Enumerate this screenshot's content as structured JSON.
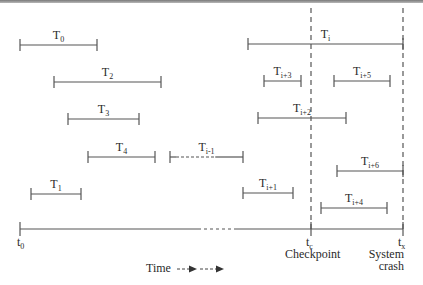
{
  "diagram": {
    "type": "transaction-timeline",
    "colors": {
      "line": "#555555",
      "text": "#2a2a2a",
      "rule": "#8a8a8a"
    },
    "transactions": [
      {
        "id": "T0",
        "base": "T",
        "sub": "0",
        "x1": 20,
        "x2": 97,
        "y": 45,
        "style": "solid"
      },
      {
        "id": "T2",
        "base": "T",
        "sub": "2",
        "x1": 54,
        "x2": 161,
        "y": 82,
        "style": "solid"
      },
      {
        "id": "T3",
        "base": "T",
        "sub": "3",
        "x1": 68,
        "x2": 139,
        "y": 119,
        "style": "solid"
      },
      {
        "id": "T4",
        "base": "T",
        "sub": "4",
        "x1": 88,
        "x2": 155,
        "y": 157,
        "style": "solid"
      },
      {
        "id": "Ti-1",
        "base": "T",
        "sub": "i-1",
        "x1": 170,
        "x2": 243,
        "y": 157,
        "style": "dashed-left"
      },
      {
        "id": "T1",
        "base": "T",
        "sub": "1",
        "x1": 31,
        "x2": 81,
        "y": 194,
        "style": "solid"
      },
      {
        "id": "Ti",
        "base": "T",
        "sub": "i",
        "x1": 248,
        "x2": 403,
        "y": 44,
        "style": "solid"
      },
      {
        "id": "Ti+3",
        "base": "T",
        "sub": "i+3",
        "x1": 264,
        "x2": 301,
        "y": 81,
        "style": "solid"
      },
      {
        "id": "Ti+5",
        "base": "T",
        "sub": "i+5",
        "x1": 334,
        "x2": 390,
        "y": 81,
        "style": "solid"
      },
      {
        "id": "Ti+2",
        "base": "T",
        "sub": "i+2",
        "x1": 258,
        "x2": 346,
        "y": 118,
        "style": "solid"
      },
      {
        "id": "Ti+6",
        "base": "T",
        "sub": "i+6",
        "x1": 337,
        "x2": 403,
        "y": 171,
        "style": "solid"
      },
      {
        "id": "Ti+1",
        "base": "T",
        "sub": "i+1",
        "x1": 243,
        "x2": 293,
        "y": 193,
        "style": "solid"
      },
      {
        "id": "Ti+4",
        "base": "T",
        "sub": "i+4",
        "x1": 321,
        "x2": 387,
        "y": 208,
        "style": "solid"
      }
    ],
    "axis": {
      "y": 229,
      "x_start": 20,
      "x_end": 403,
      "dash_from": 198,
      "dash_to": 236,
      "start_label": {
        "base": "t",
        "sub": "0"
      },
      "checkpoint": {
        "x": 311,
        "base": "t",
        "sub": "c",
        "caption": "Checkpoint"
      },
      "crash": {
        "x": 403,
        "base": "t",
        "sub": "x",
        "caption_line1": "System",
        "caption_line2": "crash"
      }
    },
    "legend": {
      "label": "Time"
    }
  }
}
